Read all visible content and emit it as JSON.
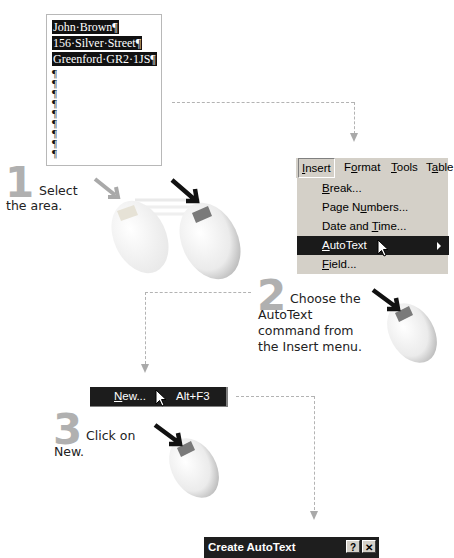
{
  "document": {
    "lines": [
      "John·Brown¶",
      "156·Silver·Street¶",
      "Greenford·GR2·1JS¶"
    ],
    "empty_paragraph_marks": 9,
    "pilcrow": "¶"
  },
  "steps": [
    {
      "number": "1",
      "text_line1": "Select",
      "text_line2": "the area."
    },
    {
      "number": "2",
      "text_line1": "Choose the",
      "text_line2": "AutoText",
      "text_line3": "command from",
      "text_line4": "the Insert menu."
    },
    {
      "number": "3",
      "text_line1": "Click on",
      "text_line2": "New."
    }
  ],
  "menubar": {
    "items": [
      {
        "pre": "",
        "ul": "I",
        "post": "nsert"
      },
      {
        "pre": "F",
        "ul": "o",
        "post": "rmat"
      },
      {
        "pre": "",
        "ul": "T",
        "post": "ools"
      },
      {
        "pre": "T",
        "ul": "a",
        "post": "ble"
      }
    ]
  },
  "insert_menu": {
    "items": [
      {
        "pre": "",
        "ul": "B",
        "post": "reak..."
      },
      {
        "pre": "Page N",
        "ul": "u",
        "post": "mbers..."
      },
      {
        "pre": "Date and ",
        "ul": "T",
        "post": "ime..."
      },
      {
        "pre": "",
        "ul": "A",
        "post": "utoText",
        "highlighted": true,
        "submenu": true
      },
      {
        "pre": "",
        "ul": "F",
        "post": "ield..."
      }
    ]
  },
  "autotext_submenu": {
    "new_item": {
      "ul": "N",
      "post": "ew...",
      "shortcut": "Alt+F3"
    }
  },
  "dialog": {
    "title": "Create AutoText",
    "help_button": "?",
    "close_button": "✕"
  },
  "colors": {
    "highlight": "#1a1a1a",
    "menu_bg": "#d4d0c8",
    "step_number": "#b0b0b0",
    "connector": "#b3b3b3"
  }
}
